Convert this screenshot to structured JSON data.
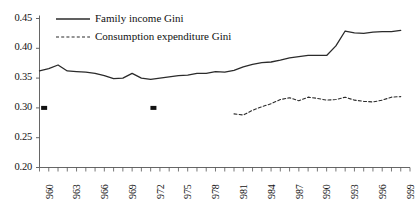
{
  "chart_data": {
    "type": "line",
    "title": "",
    "xlabel": "",
    "ylabel": "",
    "xlim": [
      1960,
      2000
    ],
    "ylim": [
      0.2,
      0.45
    ],
    "grid": false,
    "legend_position": "top-left",
    "y_ticks": [
      "0.45",
      "0.40",
      "0.35",
      "0.30",
      "0.25",
      "0.20"
    ],
    "y_tick_values": [
      0.45,
      0.4,
      0.35,
      0.3,
      0.25,
      0.2
    ],
    "x_tick_labels": [
      "960",
      "963",
      "966",
      "969",
      "972",
      "975",
      "978",
      "981",
      "984",
      "987",
      "990",
      "993",
      "996",
      "999"
    ],
    "x_tick_values": [
      1960,
      1963,
      1966,
      1969,
      1972,
      1975,
      1978,
      1981,
      1984,
      1987,
      1990,
      1993,
      1996,
      1999
    ],
    "x_minor_ticks": [
      1960,
      1961,
      1962,
      1963,
      1964,
      1965,
      1966,
      1967,
      1968,
      1969,
      1970,
      1971,
      1972,
      1973,
      1974,
      1975,
      1976,
      1977,
      1978,
      1979,
      1980,
      1981,
      1982,
      1983,
      1984,
      1985,
      1986,
      1987,
      1988,
      1989,
      1990,
      1991,
      1992,
      1993,
      1994,
      1995,
      1996,
      1997,
      1998,
      1999,
      2000
    ],
    "series": [
      {
        "name": "Family income Gini",
        "style": "solid",
        "color": "#2b2b2b",
        "x": [
          1960,
          1961,
          1962,
          1963,
          1964,
          1965,
          1966,
          1967,
          1968,
          1969,
          1970,
          1971,
          1972,
          1973,
          1974,
          1975,
          1976,
          1977,
          1978,
          1979,
          1980,
          1981,
          1982,
          1983,
          1984,
          1985,
          1986,
          1987,
          1988,
          1989,
          1990,
          1991,
          1992,
          1993,
          1994,
          1995,
          1996,
          1997,
          1998,
          1999
        ],
        "values": [
          0.362,
          0.366,
          0.372,
          0.362,
          0.361,
          0.36,
          0.358,
          0.354,
          0.349,
          0.35,
          0.358,
          0.35,
          0.348,
          0.35,
          0.352,
          0.354,
          0.355,
          0.358,
          0.358,
          0.361,
          0.36,
          0.363,
          0.369,
          0.373,
          0.376,
          0.377,
          0.38,
          0.384,
          0.386,
          0.388,
          0.388,
          0.388,
          0.404,
          0.429,
          0.426,
          0.425,
          0.427,
          0.428,
          0.428,
          0.43
        ]
      },
      {
        "name": "Consumption expenditure Gini",
        "style": "dashed",
        "color": "#2b2b2b",
        "x": [
          1981,
          1982,
          1983,
          1984,
          1985,
          1986,
          1987,
          1988,
          1989,
          1990,
          1991,
          1992,
          1993,
          1994,
          1995,
          1996,
          1997,
          1998,
          1999
        ],
        "values": [
          0.29,
          0.288,
          0.296,
          0.302,
          0.307,
          0.314,
          0.317,
          0.312,
          0.318,
          0.316,
          0.313,
          0.314,
          0.318,
          0.313,
          0.311,
          0.31,
          0.313,
          0.318,
          0.319
        ]
      }
    ],
    "markers": [
      {
        "name": "square-marker-1",
        "x": 1960.5,
        "y": 0.3
      },
      {
        "name": "square-marker-2",
        "x": 1972.3,
        "y": 0.3
      }
    ]
  },
  "legend": {
    "items": [
      {
        "label": "Family income Gini",
        "style": "solid"
      },
      {
        "label": "Consumption expenditure Gini",
        "style": "dashed"
      }
    ]
  }
}
